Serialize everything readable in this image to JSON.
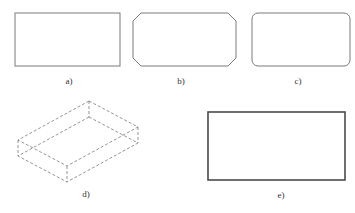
{
  "figure": {
    "panels": [
      {
        "id": "a",
        "label": "a)",
        "shape": "rectangle",
        "description": "plain rectangle with sharp corners",
        "rect": {
          "x": 15,
          "y": 13,
          "w": 105,
          "h": 53
        },
        "label_pos": {
          "x": 69,
          "y": 77
        }
      },
      {
        "id": "b",
        "label": "b)",
        "shape": "chamfered-rectangle",
        "description": "rectangle with chamfered (cut) corners",
        "rect": {
          "x": 133,
          "y": 13,
          "w": 103,
          "h": 53
        },
        "chamfer": 8,
        "label_pos": {
          "x": 181,
          "y": 77
        }
      },
      {
        "id": "c",
        "label": "c)",
        "shape": "rounded-rectangle",
        "description": "rectangle with rounded corners",
        "rect": {
          "x": 252,
          "y": 13,
          "w": 98,
          "h": 53
        },
        "radius": 6,
        "label_pos": {
          "x": 298,
          "y": 77
        }
      },
      {
        "id": "d",
        "label": "d)",
        "shape": "dashed-isometric-box",
        "description": "3D box drawn in dashed lines (isometric view)",
        "top_face": [
          [
            89,
            101
          ],
          [
            138,
            127
          ],
          [
            67,
            166
          ],
          [
            18,
            140
          ]
        ],
        "bottom_face": [
          [
            89,
            117
          ],
          [
            138,
            143
          ],
          [
            67,
            182
          ],
          [
            18,
            156
          ]
        ],
        "label_pos": {
          "x": 86,
          "y": 190
        }
      },
      {
        "id": "e",
        "label": "e)",
        "shape": "thick-rectangle",
        "description": "rectangle with thicker outline",
        "rect": {
          "x": 208,
          "y": 112,
          "w": 137,
          "h": 68
        },
        "label_pos": {
          "x": 281,
          "y": 191
        }
      }
    ],
    "colors": {
      "stroke": "#7a7a7a",
      "stroke_dark": "#4a4a4a",
      "label": "#333333",
      "background": "#ffffff"
    }
  }
}
